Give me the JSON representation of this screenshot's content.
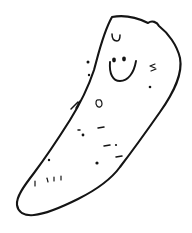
{
  "artwork": {
    "title": "Smiling potato doodle",
    "medium": "black ink line drawing on white background",
    "subject": "potato-shaped blob character with a smiley face",
    "alt_text": "A hand-drawn elongated potato shape tilted diagonally, with two dot eyes, a wide U-shaped smile, and small speckle marks scattered over its body.",
    "canvas": {
      "width": 192,
      "height": 233,
      "background_color": "#ffffff"
    },
    "ink_color": "#141414",
    "line_style": "wobbly hand-drawn single stroke"
  },
  "figure": {
    "body": {
      "name": "potato-body-outline",
      "description": "closed wobbly outline, widest at upper right, tapering to a rounded point at the lower left",
      "orientation": "tilted from upper-right to lower-left",
      "notch": "small angular bump on the upper-right edge",
      "path": "M 112 17 C 128 14 140 19 148 23 C 152 20 157 22 159 26 C 168 33 177 45 180 58 C 183 74 174 92 160 112 C 146 132 130 154 120 167 C 112 178 96 190 78 199 C 60 208 44 214 34 215 C 24 216 18 212 17 205 C 16 197 24 186 34 173 C 46 157 58 139 70 120 C 80 104 88 88 94 70 C 99 52 103 33 112 17 Z"
    },
    "face": {
      "name": "smiley-face",
      "eyes": [
        {
          "name": "left-eye",
          "cx": 114,
          "cy": 60,
          "rx": 1.9,
          "ry": 2.4
        },
        {
          "name": "right-eye",
          "cx": 124,
          "cy": 59,
          "rx": 1.9,
          "ry": 2.4
        }
      ],
      "mouth": {
        "name": "smile-mouth",
        "shape": "wide open U curve",
        "path": "M 110 62 C 109 74 113 81 120 81 C 128 81 134 73 136 61"
      }
    },
    "marks": {
      "name": "speckle-marks",
      "count": 20,
      "description": "small dots, dashes, ticks and tiny loops scattered across the body surface",
      "dots": [
        {
          "name": "mark-dot-1",
          "cx": 88,
          "cy": 62,
          "r": 1.5
        },
        {
          "name": "mark-dot-2",
          "cx": 89,
          "cy": 75,
          "r": 1.2
        },
        {
          "name": "mark-dot-3",
          "cx": 150,
          "cy": 87,
          "r": 1.3
        },
        {
          "name": "mark-dot-4",
          "cx": 83,
          "cy": 135,
          "r": 1.4
        },
        {
          "name": "mark-dot-5",
          "cx": 97,
          "cy": 163,
          "r": 1.6
        },
        {
          "name": "mark-dot-6",
          "cx": 49,
          "cy": 160,
          "r": 1.2
        },
        {
          "name": "mark-dot-7",
          "cx": 116,
          "cy": 145,
          "r": 1.1
        }
      ],
      "dashes": [
        {
          "name": "mark-dash-1",
          "path": "M 98 128 L 104 127"
        },
        {
          "name": "mark-dash-2",
          "path": "M 104 146 L 110 145"
        },
        {
          "name": "mark-dash-3",
          "path": "M 116 157 L 122 156"
        },
        {
          "name": "mark-dash-4",
          "path": "M 78 130 L 80 130"
        }
      ],
      "ticks": [
        {
          "name": "mark-tick-1",
          "path": "M 35 181 L 35 186"
        },
        {
          "name": "mark-tick-2",
          "path": "M 47 178 L 48 182"
        },
        {
          "name": "mark-tick-3",
          "path": "M 54 177 L 54 181"
        },
        {
          "name": "mark-tick-4",
          "path": "M 61 176 L 61 180"
        }
      ],
      "loops": [
        {
          "name": "mark-loop-top",
          "path": "M 112 34 C 112 39 114 41 117 41 C 119 41 120 39 120 35",
          "note": "small u-shaped mark above the face"
        },
        {
          "name": "mark-loop-circle",
          "path": "M 99 100 C 96 99 95 103 97 106 C 99 108 102 107 102 104 C 102 101 100 99 99 100 Z",
          "note": "tiny circle on the belly"
        }
      ],
      "arrow": {
        "name": "mark-arrow",
        "path": "M 71 109 L 78 102 M 76 108 L 80 101",
        "note": "small v / arrow shaped scribble on the left belly"
      },
      "squiggle": {
        "name": "mark-squiggle",
        "path": "M 155 64 L 150 66 L 155 68 M 151 71 L 156 69",
        "note": "small squiggle on the right cheek"
      }
    }
  }
}
